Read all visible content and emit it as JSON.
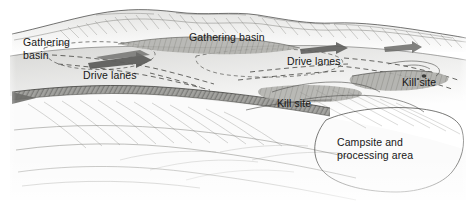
{
  "figure": {
    "kind": "archaeological-landscape-illustration",
    "medium": "pencil and ink line drawing",
    "background_color": "#ffffff",
    "ink_color": "#171717",
    "terrain_light": "#f2f2f1",
    "terrain_mid": "#cfcfcd",
    "terrain_dark": "#8d8d8a",
    "arrow_color": "#5e5e5c"
  },
  "labels": {
    "gathering_basin_left_line1": "Gathering",
    "gathering_basin_left_line2": "basin",
    "gathering_basin_mid": "Gathering basin",
    "drive_lanes_left": "Drive lanes",
    "drive_lanes_right": "Drive lanes",
    "kill_site_center": "Kill site",
    "kill_site_right": "Kill site",
    "campsite_line1": "Campsite and",
    "campsite_line2": "processing area"
  },
  "features": [
    {
      "name": "gathering-basin-left",
      "label": "Gathering basin",
      "region": "far left upland bowl"
    },
    {
      "name": "gathering-basin-mid",
      "label": "Gathering basin",
      "region": "central upland bowl"
    },
    {
      "name": "drive-lanes-left",
      "label": "Drive lanes",
      "region": "left converging dashed lanes"
    },
    {
      "name": "drive-lanes-right",
      "label": "Drive lanes",
      "region": "right converging dashed lanes"
    },
    {
      "name": "kill-site-center",
      "label": "Kill site",
      "region": "central escarpment base"
    },
    {
      "name": "kill-site-right",
      "label": "Kill site",
      "region": "right escarpment base"
    },
    {
      "name": "campsite-area",
      "label": "Campsite and processing area",
      "region": "lower right outlined basin"
    }
  ]
}
